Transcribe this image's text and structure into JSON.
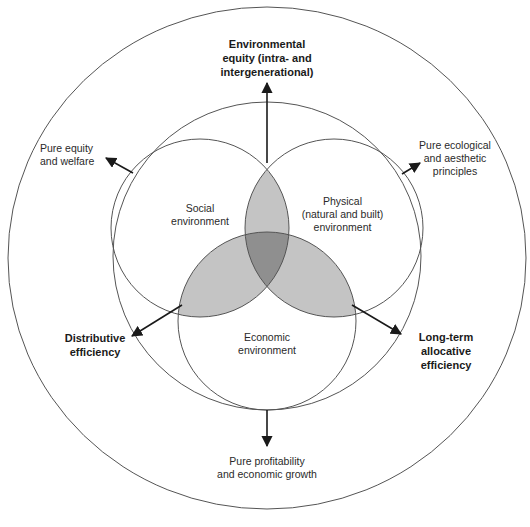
{
  "diagram": {
    "circles": {
      "social": {
        "lines": [
          "Social",
          "environment"
        ]
      },
      "physical": {
        "lines": [
          "Physical",
          "(natural and built)",
          "environment"
        ]
      },
      "economic": {
        "lines": [
          "Economic",
          "environment"
        ]
      }
    },
    "outcomes": {
      "top": {
        "lines": [
          "Environmental",
          "equity (intra- and",
          "intergenerational)"
        ],
        "bold": true
      },
      "upper_left": {
        "lines": [
          "Pure equity",
          "and welfare"
        ],
        "bold": false
      },
      "upper_right": {
        "lines": [
          "Pure ecological",
          "and aesthetic",
          "principles"
        ],
        "bold": false
      },
      "lower_left": {
        "lines": [
          "Distributive",
          "efficiency"
        ],
        "bold": true
      },
      "lower_right": {
        "lines": [
          "Long-term",
          "allocative",
          "efficiency"
        ],
        "bold": true
      },
      "bottom": {
        "lines": [
          "Pure profitability",
          "and economic growth"
        ],
        "bold": false
      }
    },
    "colors": {
      "line": "#555555",
      "pair_overlap": "#c4c4c4",
      "triple_overlap": "#8f8f8f",
      "arrow": "#1a1a1a"
    }
  }
}
